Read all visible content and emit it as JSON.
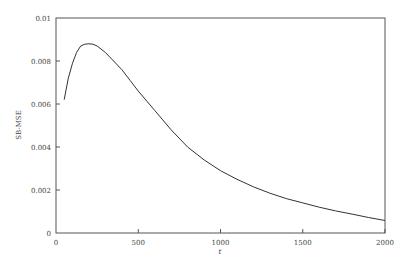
{
  "chart_data": {
    "type": "line",
    "title": "",
    "xlabel": "t",
    "ylabel": "SB-MSE",
    "xlim": [
      0,
      2000
    ],
    "ylim": [
      0,
      0.01
    ],
    "grid": false,
    "legend": null,
    "x_ticks": [
      0,
      500,
      1000,
      1500,
      2000
    ],
    "x_tick_labels": [
      "0",
      "500",
      "1000",
      "1500",
      "2000"
    ],
    "y_ticks": [
      0,
      0.002,
      0.004,
      0.006,
      0.008,
      0.01
    ],
    "y_tick_labels": [
      "0",
      "0.002",
      "0.004",
      "0.006",
      "0.008",
      "0.01"
    ],
    "series": [
      {
        "name": "SB-MSE",
        "color": "#333333",
        "x": [
          50,
          75,
          100,
          125,
          150,
          175,
          200,
          225,
          250,
          300,
          350,
          400,
          450,
          500,
          600,
          700,
          800,
          900,
          1000,
          1100,
          1200,
          1300,
          1400,
          1500,
          1600,
          1700,
          1800,
          1900,
          2000
        ],
        "y": [
          0.0062,
          0.0072,
          0.0079,
          0.0084,
          0.0087,
          0.00878,
          0.0088,
          0.00878,
          0.0087,
          0.0084,
          0.008,
          0.0076,
          0.0071,
          0.0066,
          0.0057,
          0.0048,
          0.004,
          0.0034,
          0.0029,
          0.0025,
          0.00215,
          0.00185,
          0.0016,
          0.0014,
          0.0012,
          0.00103,
          0.00088,
          0.00072,
          0.00058
        ]
      }
    ]
  }
}
